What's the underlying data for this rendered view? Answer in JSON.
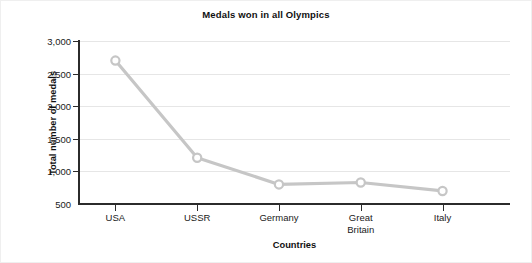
{
  "chart_data": {
    "type": "line",
    "title": "Medals won in all Olympics",
    "xlabel": "Countries",
    "ylabel": "Total number of medals",
    "categories": [
      "USA",
      "USSR",
      "Germany",
      "Great Britain",
      "Italy"
    ],
    "category_lines": [
      [
        "USA"
      ],
      [
        "USSR"
      ],
      [
        "Germany"
      ],
      [
        "Great",
        "Britain"
      ],
      [
        "Italy"
      ]
    ],
    "values": [
      2700,
      1210,
      800,
      830,
      700
    ],
    "series": [
      {
        "name": "Total number of medals",
        "values": [
          2700,
          1210,
          800,
          830,
          700
        ]
      }
    ],
    "ylim": [
      500,
      3000
    ],
    "ytick_values": [
      500,
      1000,
      1500,
      2000,
      2500,
      3000
    ],
    "ytick_labels": [
      "500",
      "1,000",
      "1,500",
      "2,000",
      "2,500",
      "3,000"
    ],
    "grid": true,
    "legend": "none",
    "marker": "open-circle",
    "line_color": "#c6c6c6",
    "marker_color": "#c6c6c6",
    "grid_color": "#e6e6e6",
    "axis_color": "#2b2b2b",
    "background_color": "#ffffff",
    "text_color": "#1a1a1a"
  }
}
